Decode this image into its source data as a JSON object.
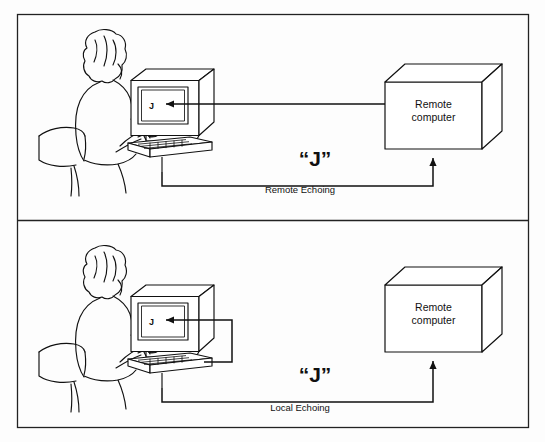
{
  "figure": {
    "background_color": "#fdfdfd",
    "line_color": "#1a1a1a",
    "panels": [
      {
        "id": "remote-echoing",
        "caption": "Remote Echoing",
        "transmitted_character": "“J”",
        "screen_character": "J",
        "remote_box_label_line1": "Remote",
        "remote_box_label_line2": "computer",
        "echo_source": "remote computer"
      },
      {
        "id": "local-echoing",
        "caption": "Local Echoing",
        "transmitted_character": "“J”",
        "screen_character": "J",
        "remote_box_label_line1": "Remote",
        "remote_box_label_line2": "computer",
        "echo_source": "local terminal"
      }
    ]
  }
}
